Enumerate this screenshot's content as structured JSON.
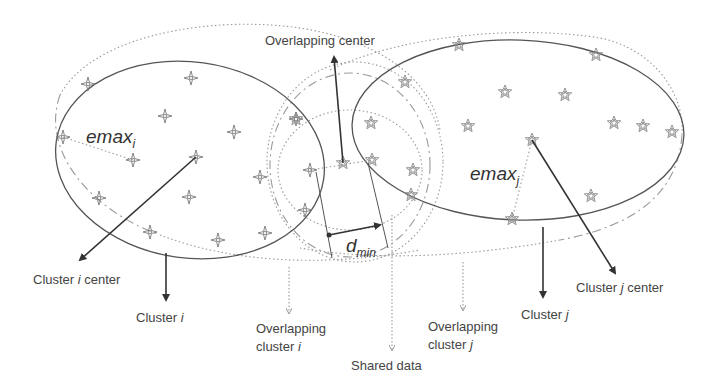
{
  "diagram": {
    "labels": {
      "overlapping_center": "Overlapping center",
      "emax_i_main": "emax",
      "emax_i_sub": "i",
      "emax_j_main": "emax",
      "emax_j_sub": "j",
      "dmin_main": "d",
      "dmin_sub": "min",
      "cluster_i_center_prefix": "Cluster ",
      "cluster_i_center_var": "i",
      "cluster_i_center_suffix": " center",
      "cluster_i_prefix": "Cluster ",
      "cluster_i_var": "i",
      "overlap_i_line1": "Overlapping",
      "overlap_i_line2_prefix": "cluster ",
      "overlap_i_line2_var": "i",
      "shared_data": "Shared data",
      "overlap_j_line1": "Overlapping",
      "overlap_j_line2_prefix": "cluster ",
      "overlap_j_line2_var": "j",
      "cluster_j_prefix": "Cluster ",
      "cluster_j_var": "j",
      "cluster_j_center_prefix": "Cluster ",
      "cluster_j_center_var": "j",
      "cluster_j_center_suffix": " center"
    },
    "legend_markers": {
      "cluster_i_points": "four-point-star-icon",
      "cluster_j_points": "five-point-star-icon"
    },
    "cluster_i_points": [
      [
        88,
        84
      ],
      [
        191,
        78
      ],
      [
        165,
        116
      ],
      [
        234,
        132
      ],
      [
        63,
        137
      ],
      [
        133,
        160
      ],
      [
        196,
        157
      ],
      [
        99,
        198
      ],
      [
        189,
        197
      ],
      [
        260,
        177
      ],
      [
        296,
        119
      ],
      [
        310,
        170
      ],
      [
        150,
        232
      ],
      [
        218,
        240
      ],
      [
        265,
        233
      ],
      [
        305,
        210
      ]
    ],
    "cluster_j_points": [
      [
        459,
        45
      ],
      [
        596,
        55
      ],
      [
        505,
        92
      ],
      [
        565,
        95
      ],
      [
        371,
        123
      ],
      [
        468,
        126
      ],
      [
        614,
        123
      ],
      [
        643,
        126
      ],
      [
        672,
        132
      ],
      [
        532,
        140
      ],
      [
        343,
        163
      ],
      [
        372,
        160
      ],
      [
        413,
        170
      ],
      [
        591,
        196
      ],
      [
        411,
        195
      ],
      [
        512,
        219
      ]
    ],
    "colors": {
      "solid_line": "#555555",
      "dashed_line": "#9a9a9a",
      "arrow": "#333333",
      "text": "#444444",
      "background": "#ffffff"
    }
  }
}
